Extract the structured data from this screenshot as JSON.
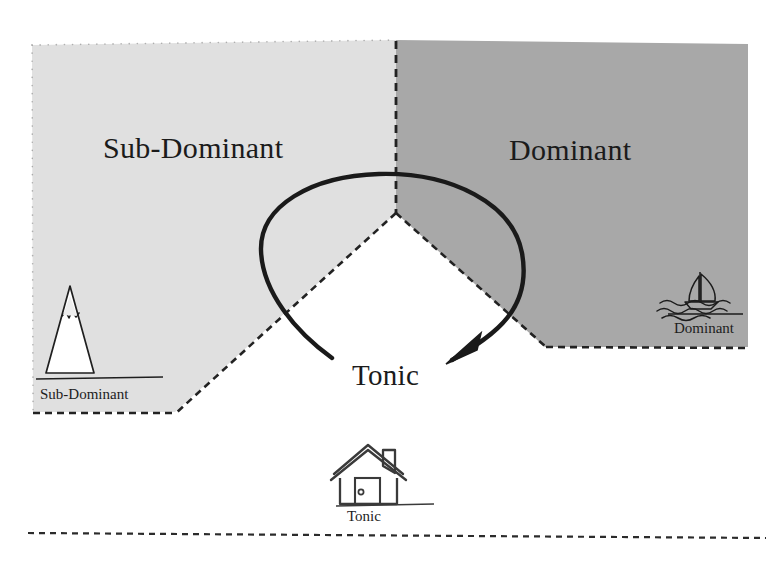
{
  "diagram": {
    "title_hidden": "",
    "type": "harmonic-function-map",
    "regions": [
      {
        "id": "sub-dominant",
        "label": "Sub-Dominant",
        "fill": "#e0e0e0",
        "icon": "mountain-icon",
        "icon_caption": "Sub-Dominant"
      },
      {
        "id": "dominant",
        "label": "Dominant",
        "fill": "#a8a8a8",
        "icon": "sailboat-icon",
        "icon_caption": "Dominant"
      },
      {
        "id": "tonic",
        "label": "Tonic",
        "fill": "#ffffff",
        "icon": "house-icon",
        "icon_caption": "Tonic"
      }
    ],
    "arrow": {
      "name": "motion-arrow",
      "description": "curved arc from sub-dominant side over the top and down into tonic",
      "color": "#1a1a1a",
      "direction": "counterclockwise-to-tonic"
    },
    "colors": {
      "sub_dominant_fill": "#e0e0e0",
      "dominant_fill": "#a8a8a8",
      "tonic_fill": "#ffffff",
      "outline": "#1a1a1a",
      "background": "#ffffff"
    },
    "baseline_rule": "dashed-horizontal-baseline"
  }
}
